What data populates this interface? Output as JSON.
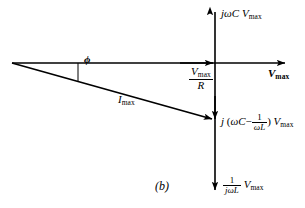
{
  "figure": {
    "caption": "(b)",
    "type": "phasor-diagram",
    "background_color": "#ffffff",
    "stroke_color": "#000000"
  },
  "axes": {
    "horizontal": {
      "name": "real-axis",
      "label": "V",
      "label_subscript": "max",
      "origin": [
        12,
        63
      ],
      "end": [
        287,
        63
      ],
      "arrow": "right"
    },
    "vertical": {
      "name": "imaginary-axis",
      "x": 215,
      "top": 10,
      "bottom": 192,
      "arrow_top": "up",
      "arrow_bottom": "down"
    }
  },
  "phasors": [
    {
      "name": "capacitive-current",
      "label_j": "j",
      "label_omega_c": "ωC",
      "label_v": "V",
      "label_sub": "max",
      "direction": "up",
      "from": [
        215,
        63
      ],
      "to": [
        215,
        10
      ]
    },
    {
      "name": "resistive-current",
      "label_numerator_v": "V",
      "label_numerator_sub": "max",
      "label_denominator": "R",
      "direction": "right",
      "from": [
        12,
        63
      ],
      "to": [
        215,
        63
      ]
    },
    {
      "name": "net-reactive-current",
      "label_j": "j",
      "label_open": "(",
      "label_omega_c": "ωC",
      "label_minus": "−",
      "label_frac_num": "1",
      "label_frac_den": "ωL",
      "label_close": ")",
      "label_v": "V",
      "label_sub": "max",
      "direction": "down",
      "from": [
        215,
        63
      ],
      "to": [
        215,
        120
      ]
    },
    {
      "name": "inductive-current",
      "label_frac_num": "1",
      "label_frac_den_j": "j",
      "label_frac_den_wl": "ωL",
      "label_v": "V",
      "label_sub": "max",
      "direction": "down",
      "from": [
        215,
        63
      ],
      "to": [
        215,
        192
      ]
    },
    {
      "name": "total-current",
      "label": "I",
      "label_sub": "max",
      "from": [
        12,
        63
      ],
      "to": [
        215,
        120
      ],
      "arrow": "end"
    }
  ],
  "angle": {
    "name": "phase-angle",
    "symbol": "ϕ",
    "vertex": [
      12,
      63
    ],
    "tick_x": 78,
    "tick_from_y": 63,
    "tick_to_y": 81
  }
}
